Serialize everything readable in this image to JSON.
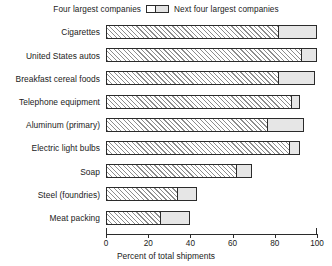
{
  "legend": {
    "left_label": "Four largest companies",
    "right_label": "Next four largest companies",
    "swatch_name": "legend-swatch"
  },
  "axis": {
    "xlabel": "Percent of total shipments",
    "ticks": [
      "0",
      "20",
      "40",
      "60",
      "80",
      "100"
    ]
  },
  "chart_data": {
    "type": "bar",
    "orientation": "horizontal",
    "stacked": true,
    "title": "",
    "xlabel": "Percent of total shipments",
    "ylabel": "",
    "xlim": [
      0,
      100
    ],
    "grid": false,
    "legend_position": "top-center",
    "categories": [
      "Cigarettes",
      "United States autos",
      "Breakfast cereal foods",
      "Telephone equipment",
      "Aluminum (primary)",
      "Electric light bulbs",
      "Soap",
      "Steel (foundries)",
      "Meat packing"
    ],
    "series": [
      {
        "name": "Four largest companies",
        "values": [
          82,
          93,
          82,
          88,
          77,
          87,
          62,
          34,
          26
        ]
      },
      {
        "name": "Next four largest companies",
        "values": [
          18,
          7,
          17,
          4,
          17,
          5,
          7,
          9,
          14
        ]
      }
    ],
    "totals": [
      100,
      100,
      99,
      92,
      94,
      92,
      69,
      43,
      40
    ]
  }
}
